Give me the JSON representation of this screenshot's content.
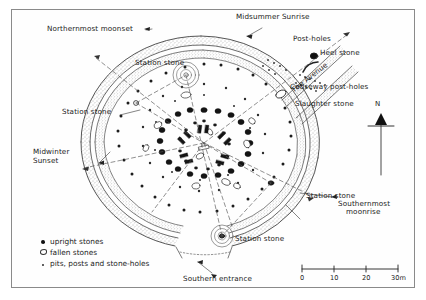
{
  "figure": {
    "kind": "archaeological-plan"
  },
  "labels": {
    "northernmost_moonset": "Northernmost moonset",
    "midsummer_sunrise": "Midsummer Sunrise",
    "post_holes": "Post-holes",
    "heel_stone": "Heel stone",
    "the_avenue": "The Avenue",
    "causeway_post_holes": "Causeway post-holes",
    "slaughter_stone": "Slaughter stone",
    "station_stone_nw": "Station stone",
    "station_stone_w": "Station stone",
    "station_stone_se": "Station stone",
    "station_stone_s": "Station stone",
    "midwinter_sunset_line1": "Midwinter",
    "midwinter_sunset_line2": "Sunset",
    "southernmost_moonrise_line1": "Southernmost",
    "southernmost_moonrise_line2": "moonrise",
    "southern_entrance": "Southern entrance"
  },
  "compass": {
    "north_label": "N"
  },
  "legend": {
    "items": [
      {
        "symbol": "filled-dot",
        "label": "upright stones"
      },
      {
        "symbol": "open-oval",
        "label": "fallen stones"
      },
      {
        "symbol": "small-dot",
        "label": "pits, posts and stone-holes"
      }
    ]
  },
  "scale": {
    "ticks": [
      "0",
      "10",
      "20",
      "30"
    ],
    "unit": "m",
    "last_tick_label": "30m"
  },
  "colors": {
    "ink": "#1a1a1a",
    "frame": "#8a8a8a",
    "paper": "#ffffff",
    "hatch": "#6f6f6f"
  }
}
